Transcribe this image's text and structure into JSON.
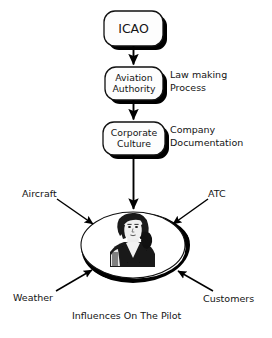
{
  "diagram": {
    "caption": "Influences On The Pilot",
    "flow_boxes": [
      {
        "id": "icao",
        "label_lines": [
          "ICAO"
        ],
        "annotation": null
      },
      {
        "id": "aviation-authority",
        "label_lines": [
          "Aviation",
          "Authority"
        ],
        "annotation": [
          "Law making",
          "Process"
        ]
      },
      {
        "id": "corporate-culture",
        "label_lines": [
          "Corporate",
          "Culture"
        ],
        "annotation": [
          "Company",
          "Documentation"
        ]
      }
    ],
    "annotations": {
      "law_making_line1": "Law making",
      "law_making_line2": "Process",
      "company_line1": "Company",
      "company_line2": "Documentation"
    },
    "center": {
      "id": "pilot",
      "shape": "ellipse",
      "image_alt": "pilot-portrait"
    },
    "influences": [
      {
        "id": "aircraft",
        "label": "Aircraft",
        "position": "top-left"
      },
      {
        "id": "atc",
        "label": "ATC",
        "position": "top-right"
      },
      {
        "id": "weather",
        "label": "Weather",
        "position": "bottom-left"
      },
      {
        "id": "customers",
        "label": "Customers",
        "position": "bottom-right"
      }
    ],
    "colors": {
      "ink": "#141414",
      "stroke": "#000000",
      "shadow": "#000000",
      "background": "#ffffff",
      "box_fill": "#fdfdfd"
    }
  }
}
